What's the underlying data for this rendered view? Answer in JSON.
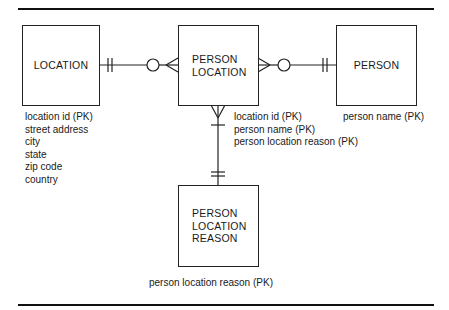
{
  "diagram": {
    "type": "entity-relationship",
    "entities": [
      {
        "id": "location",
        "name": "LOCATION",
        "attributes": [
          "location id (PK)",
          "street address",
          "city",
          "state",
          "zip code",
          "country"
        ]
      },
      {
        "id": "person_location",
        "name_lines": [
          "PERSON",
          "LOCATION"
        ],
        "attributes": [
          "location id (PK)",
          "person name (PK)",
          "person location reason (PK)"
        ]
      },
      {
        "id": "person",
        "name": "PERSON",
        "attributes": [
          "person name (PK)"
        ]
      },
      {
        "id": "person_location_reason",
        "name_lines": [
          "PERSON",
          "LOCATION",
          "REASON"
        ],
        "attributes": [
          "person location reason (PK)"
        ]
      }
    ],
    "relationships": [
      {
        "from": "LOCATION",
        "to": "PERSON LOCATION",
        "from_cardinality": "exactly one",
        "to_cardinality": "zero or many"
      },
      {
        "from": "PERSON",
        "to": "PERSON LOCATION",
        "from_cardinality": "exactly one",
        "to_cardinality": "zero or many"
      },
      {
        "from": "PERSON LOCATION REASON",
        "to": "PERSON LOCATION",
        "from_cardinality": "exactly one",
        "to_cardinality": "one or many"
      }
    ],
    "colors": {
      "line": "#222222",
      "background": "#ffffff"
    }
  }
}
